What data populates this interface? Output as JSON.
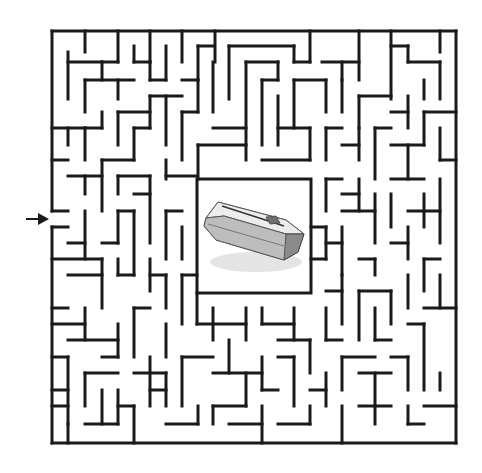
{
  "puzzle": {
    "type": "maze",
    "goal_image": "coffin-icon",
    "entrance_side": "left",
    "entrance_arrow": {
      "x1": 26,
      "y1": 219,
      "x2": 48,
      "y2": 219
    },
    "colors": {
      "wall": "#1a1a1a",
      "background": "#ffffff",
      "coffin_light": "#e8e8e8",
      "coffin_mid": "#bdbdbd",
      "coffin_dark": "#7a7a7a"
    },
    "border": {
      "left": 52,
      "top": 31,
      "right": 456,
      "bottom": 443
    },
    "center_box": {
      "left": 197,
      "top": 179,
      "right": 311,
      "bottom": 293
    },
    "walls": [
      [
        52,
        31,
        456,
        31
      ],
      [
        456,
        31,
        456,
        443
      ],
      [
        52,
        443,
        456,
        443
      ],
      [
        52,
        31,
        52,
        211
      ],
      [
        52,
        227,
        52,
        443
      ],
      [
        85,
        31,
        85,
        52
      ],
      [
        118,
        31,
        118,
        62
      ],
      [
        150,
        31,
        150,
        62
      ],
      [
        182,
        31,
        182,
        62
      ],
      [
        215,
        31,
        215,
        62
      ],
      [
        310,
        31,
        310,
        62
      ],
      [
        359,
        31,
        359,
        80
      ],
      [
        391,
        31,
        391,
        99
      ],
      [
        440,
        31,
        440,
        52
      ],
      [
        68,
        52,
        68,
        99
      ],
      [
        68,
        62,
        102,
        62
      ],
      [
        102,
        62,
        102,
        80
      ],
      [
        102,
        62,
        118,
        62
      ],
      [
        134,
        46,
        134,
        62
      ],
      [
        134,
        62,
        150,
        62
      ],
      [
        150,
        62,
        150,
        80
      ],
      [
        150,
        80,
        166,
        80
      ],
      [
        166,
        46,
        166,
        80
      ],
      [
        198,
        46,
        198,
        80
      ],
      [
        198,
        46,
        213,
        46
      ],
      [
        229,
        46,
        229,
        99
      ],
      [
        229,
        46,
        294,
        46
      ],
      [
        294,
        46,
        294,
        62
      ],
      [
        294,
        62,
        310,
        62
      ],
      [
        322,
        62,
        359,
        62
      ],
      [
        391,
        46,
        408,
        46
      ],
      [
        408,
        46,
        408,
        62
      ],
      [
        408,
        62,
        440,
        62
      ],
      [
        440,
        62,
        440,
        99
      ],
      [
        424,
        80,
        424,
        99
      ],
      [
        85,
        80,
        85,
        112
      ],
      [
        85,
        80,
        134,
        80
      ],
      [
        118,
        80,
        118,
        99
      ],
      [
        150,
        96,
        150,
        128
      ],
      [
        150,
        96,
        182,
        96
      ],
      [
        166,
        96,
        166,
        145
      ],
      [
        182,
        80,
        198,
        80
      ],
      [
        198,
        80,
        198,
        112
      ],
      [
        213,
        62,
        213,
        112
      ],
      [
        246,
        62,
        246,
        160
      ],
      [
        246,
        62,
        278,
        62
      ],
      [
        278,
        62,
        278,
        80
      ],
      [
        262,
        80,
        278,
        80
      ],
      [
        262,
        80,
        262,
        145
      ],
      [
        294,
        80,
        294,
        128
      ],
      [
        294,
        80,
        326,
        80
      ],
      [
        326,
        80,
        326,
        112
      ],
      [
        342,
        80,
        342,
        112
      ],
      [
        342,
        62,
        342,
        80
      ],
      [
        359,
        96,
        359,
        128
      ],
      [
        359,
        96,
        391,
        96
      ],
      [
        391,
        112,
        408,
        112
      ],
      [
        408,
        96,
        408,
        128
      ],
      [
        424,
        112,
        424,
        145
      ],
      [
        424,
        112,
        456,
        112
      ],
      [
        68,
        128,
        68,
        145
      ],
      [
        52,
        128,
        85,
        128
      ],
      [
        85,
        128,
        85,
        160
      ],
      [
        85,
        128,
        102,
        128
      ],
      [
        102,
        112,
        102,
        128
      ],
      [
        118,
        112,
        150,
        112
      ],
      [
        118,
        112,
        118,
        145
      ],
      [
        134,
        128,
        150,
        128
      ],
      [
        134,
        128,
        134,
        160
      ],
      [
        182,
        112,
        198,
        112
      ],
      [
        182,
        112,
        182,
        160
      ],
      [
        213,
        128,
        246,
        128
      ],
      [
        198,
        145,
        246,
        145
      ],
      [
        198,
        145,
        198,
        179
      ],
      [
        278,
        96,
        278,
        145
      ],
      [
        278,
        128,
        310,
        128
      ],
      [
        310,
        128,
        310,
        160
      ],
      [
        262,
        160,
        310,
        160
      ],
      [
        326,
        128,
        342,
        128
      ],
      [
        326,
        128,
        326,
        160
      ],
      [
        342,
        145,
        359,
        145
      ],
      [
        359,
        128,
        359,
        160
      ],
      [
        375,
        128,
        391,
        128
      ],
      [
        375,
        128,
        375,
        179
      ],
      [
        391,
        145,
        424,
        145
      ],
      [
        408,
        145,
        408,
        179
      ],
      [
        440,
        128,
        440,
        160
      ],
      [
        440,
        160,
        456,
        160
      ],
      [
        52,
        160,
        68,
        160
      ],
      [
        68,
        176,
        102,
        176
      ],
      [
        85,
        176,
        85,
        194
      ],
      [
        102,
        160,
        102,
        211
      ],
      [
        102,
        160,
        134,
        160
      ],
      [
        118,
        176,
        118,
        194
      ],
      [
        118,
        176,
        150,
        176
      ],
      [
        134,
        194,
        150,
        194
      ],
      [
        150,
        176,
        150,
        243
      ],
      [
        166,
        160,
        166,
        179
      ],
      [
        166,
        176,
        197,
        176
      ],
      [
        326,
        179,
        342,
        179
      ],
      [
        326,
        179,
        326,
        211
      ],
      [
        342,
        194,
        359,
        194
      ],
      [
        359,
        179,
        359,
        211
      ],
      [
        342,
        211,
        375,
        211
      ],
      [
        375,
        194,
        375,
        243
      ],
      [
        391,
        179,
        424,
        179
      ],
      [
        391,
        194,
        391,
        227
      ],
      [
        408,
        211,
        440,
        211
      ],
      [
        424,
        194,
        424,
        227
      ],
      [
        440,
        179,
        440,
        243
      ],
      [
        52,
        211,
        68,
        211
      ],
      [
        52,
        227,
        68,
        227
      ],
      [
        68,
        243,
        85,
        243
      ],
      [
        85,
        211,
        85,
        259
      ],
      [
        118,
        211,
        118,
        243
      ],
      [
        102,
        243,
        118,
        243
      ],
      [
        118,
        211,
        134,
        211
      ],
      [
        134,
        211,
        134,
        275
      ],
      [
        166,
        211,
        166,
        259
      ],
      [
        166,
        211,
        182,
        211
      ],
      [
        182,
        227,
        182,
        259
      ],
      [
        311,
        227,
        326,
        227
      ],
      [
        326,
        227,
        326,
        259
      ],
      [
        326,
        243,
        342,
        243
      ],
      [
        342,
        227,
        342,
        275
      ],
      [
        359,
        259,
        375,
        259
      ],
      [
        375,
        259,
        375,
        275
      ],
      [
        391,
        243,
        408,
        243
      ],
      [
        408,
        227,
        408,
        259
      ],
      [
        424,
        259,
        440,
        259
      ],
      [
        424,
        259,
        424,
        291
      ],
      [
        52,
        259,
        102,
        259
      ],
      [
        68,
        275,
        102,
        275
      ],
      [
        102,
        259,
        102,
        308
      ],
      [
        118,
        259,
        118,
        275
      ],
      [
        118,
        275,
        134,
        275
      ],
      [
        150,
        259,
        150,
        291
      ],
      [
        150,
        275,
        166,
        275
      ],
      [
        166,
        275,
        166,
        308
      ],
      [
        182,
        275,
        197,
        275
      ],
      [
        182,
        275,
        182,
        324
      ],
      [
        311,
        259,
        326,
        259
      ],
      [
        326,
        291,
        342,
        291
      ],
      [
        342,
        275,
        342,
        324
      ],
      [
        359,
        291,
        391,
        291
      ],
      [
        359,
        291,
        359,
        340
      ],
      [
        391,
        291,
        391,
        324
      ],
      [
        408,
        275,
        408,
        308
      ],
      [
        440,
        275,
        440,
        308
      ],
      [
        424,
        308,
        456,
        308
      ],
      [
        52,
        308,
        68,
        308
      ],
      [
        52,
        324,
        85,
        324
      ],
      [
        85,
        308,
        85,
        340
      ],
      [
        68,
        340,
        118,
        340
      ],
      [
        118,
        324,
        118,
        357
      ],
      [
        102,
        357,
        118,
        357
      ],
      [
        134,
        308,
        150,
        308
      ],
      [
        134,
        308,
        134,
        357
      ],
      [
        166,
        324,
        166,
        357
      ],
      [
        197,
        293,
        197,
        324
      ],
      [
        197,
        324,
        246,
        324
      ],
      [
        246,
        308,
        246,
        340
      ],
      [
        213,
        308,
        213,
        340
      ],
      [
        262,
        308,
        262,
        324
      ],
      [
        262,
        324,
        294,
        324
      ],
      [
        294,
        308,
        294,
        340
      ],
      [
        278,
        340,
        310,
        340
      ],
      [
        310,
        340,
        310,
        373
      ],
      [
        326,
        308,
        326,
        340
      ],
      [
        326,
        340,
        342,
        340
      ],
      [
        375,
        308,
        375,
        340
      ],
      [
        375,
        340,
        391,
        340
      ],
      [
        408,
        324,
        424,
        324
      ],
      [
        424,
        324,
        424,
        390
      ],
      [
        52,
        357,
        68,
        357
      ],
      [
        68,
        357,
        68,
        424
      ],
      [
        52,
        390,
        68,
        390
      ],
      [
        85,
        373,
        85,
        406
      ],
      [
        85,
        373,
        118,
        373
      ],
      [
        102,
        390,
        102,
        424
      ],
      [
        118,
        390,
        118,
        424
      ],
      [
        134,
        373,
        166,
        373
      ],
      [
        150,
        357,
        150,
        406
      ],
      [
        150,
        390,
        166,
        390
      ],
      [
        166,
        373,
        166,
        406
      ],
      [
        182,
        357,
        182,
        406
      ],
      [
        182,
        357,
        213,
        357
      ],
      [
        229,
        340,
        229,
        373
      ],
      [
        213,
        373,
        262,
        373
      ],
      [
        246,
        373,
        246,
        406
      ],
      [
        262,
        357,
        262,
        390
      ],
      [
        262,
        390,
        278,
        390
      ],
      [
        278,
        357,
        294,
        357
      ],
      [
        294,
        357,
        294,
        406
      ],
      [
        310,
        390,
        326,
        390
      ],
      [
        326,
        373,
        326,
        406
      ],
      [
        342,
        357,
        342,
        390
      ],
      [
        342,
        357,
        375,
        357
      ],
      [
        359,
        373,
        391,
        373
      ],
      [
        375,
        373,
        375,
        406
      ],
      [
        391,
        357,
        408,
        357
      ],
      [
        408,
        357,
        408,
        390
      ],
      [
        424,
        406,
        456,
        406
      ],
      [
        440,
        373,
        440,
        390
      ],
      [
        52,
        406,
        68,
        406
      ],
      [
        68,
        424,
        68,
        443
      ],
      [
        85,
        424,
        118,
        424
      ],
      [
        118,
        406,
        134,
        406
      ],
      [
        134,
        406,
        134,
        443
      ],
      [
        166,
        424,
        198,
        424
      ],
      [
        198,
        406,
        198,
        424
      ],
      [
        213,
        406,
        246,
        406
      ],
      [
        213,
        406,
        213,
        424
      ],
      [
        229,
        424,
        262,
        424
      ],
      [
        262,
        406,
        262,
        443
      ],
      [
        278,
        424,
        310,
        424
      ],
      [
        310,
        406,
        310,
        424
      ],
      [
        342,
        406,
        342,
        443
      ],
      [
        359,
        406,
        391,
        406
      ],
      [
        375,
        406,
        375,
        424
      ],
      [
        408,
        406,
        408,
        424
      ],
      [
        408,
        424,
        424,
        424
      ]
    ]
  }
}
